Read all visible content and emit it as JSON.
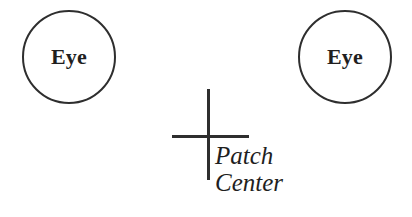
{
  "diagram": {
    "background_color": "#ffffff",
    "stroke_color": "#2e2e2e",
    "text_color": "#1f1f1f",
    "nodes": [
      {
        "id": "left-eye",
        "label": "Eye",
        "shape": "circle"
      },
      {
        "id": "right-eye",
        "label": "Eye",
        "shape": "circle"
      }
    ],
    "marker": {
      "name": "crosshair",
      "shape": "plus"
    },
    "caption": {
      "line1": "Patch",
      "line2": "Center"
    }
  }
}
